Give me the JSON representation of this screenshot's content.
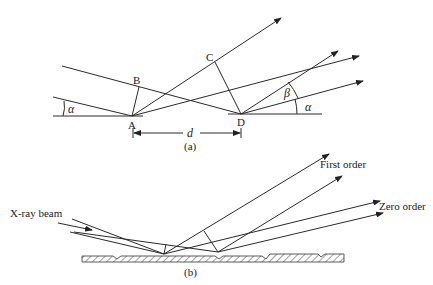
{
  "figure_a": {
    "point_labels": {
      "A": "A",
      "B": "B",
      "C": "C",
      "D": "D"
    },
    "angle_labels": {
      "alpha_left": "α",
      "alpha_right": "α",
      "beta": "β"
    },
    "distance_label": "d",
    "caption": "(a)"
  },
  "figure_b": {
    "incident_label": "X-ray beam",
    "first_order_label": "First order",
    "zero_order_label": "Zero order",
    "caption": "(b)"
  }
}
